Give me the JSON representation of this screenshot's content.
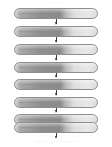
{
  "figure": {
    "type": "flowchart",
    "orientation": "vertical",
    "node_shape": "rounded-capsule",
    "connector": "down-arrow",
    "caption_top": "·· ·· ··   ·· ·· ·· ··",
    "caption_bottom": "···· ·· ·· ···· ··· ···· ·· · ··"
  },
  "colors": {
    "node_border": "#8e8e8e",
    "node_fill_dark": "#8a8a8a",
    "node_fill_light": "#e8e8e8",
    "arrow": "#2e2e2e",
    "label_text": "#4a4a4a",
    "caption_text": "#b4b4b4",
    "background": "#ffffff"
  },
  "nodes": [
    {
      "id": "node-1",
      "label": "······ ···",
      "top": 0
    },
    {
      "id": "node-2",
      "label": "······ ···",
      "top": 18
    },
    {
      "id": "node-3",
      "label": "······ ···",
      "top": 36
    },
    {
      "id": "node-4",
      "label": "······ ···",
      "top": 54
    },
    {
      "id": "node-5",
      "label": "······ ···",
      "top": 71
    },
    {
      "id": "node-6",
      "label": "······ ···",
      "top": 89
    },
    {
      "id": "node-7",
      "label": "······ ···",
      "top": 106
    },
    {
      "id": "node-8",
      "label": "······ ···",
      "top": 114
    }
  ],
  "connectors": [
    {
      "id": "arrow-1-2",
      "from": "node-1",
      "to": "node-2",
      "top": 11
    },
    {
      "id": "arrow-2-3",
      "from": "node-2",
      "to": "node-3",
      "top": 29
    },
    {
      "id": "arrow-3-4",
      "from": "node-3",
      "to": "node-4",
      "top": 47
    },
    {
      "id": "arrow-4-5",
      "from": "node-4",
      "to": "node-5",
      "top": 64
    },
    {
      "id": "arrow-5-6",
      "from": "node-5",
      "to": "node-6",
      "top": 82
    },
    {
      "id": "arrow-6-7",
      "from": "node-6",
      "to": "node-7",
      "top": 99
    },
    {
      "id": "arrow-7-8",
      "from": "node-7",
      "to": "node-8",
      "top": 117
    }
  ]
}
